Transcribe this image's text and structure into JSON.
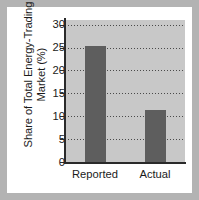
{
  "chart_data": {
    "type": "bar",
    "title": "",
    "subtitle": "",
    "xlabel": "",
    "ylabel": "Share of Total Energy-Trading Market (%)",
    "ylabel_lines": [
      "Share of Total Energy-Trading",
      "Market (%)"
    ],
    "categories": [
      "Reported",
      "Actual"
    ],
    "values": [
      25.3,
      11.3
    ],
    "ylim": [
      0,
      31
    ],
    "yticks": [
      0,
      5,
      10,
      15,
      20,
      25,
      30
    ],
    "ytick_labels": [
      "0",
      "5",
      "10",
      "15",
      "20",
      "25",
      "30"
    ],
    "grid": true,
    "grid_axis": "y",
    "grid_style": "dotted",
    "legend": false,
    "legend_position": "none",
    "bar_color": "#5e5e5e",
    "plot_background": "#c8c8c8",
    "figure_background": "#ffffff",
    "page_background": "#b3b3b3",
    "axis_color": "#2a2a2a",
    "text_color": "#1b1b1b"
  }
}
